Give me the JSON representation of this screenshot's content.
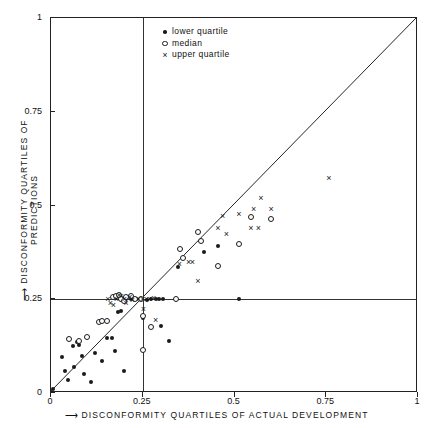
{
  "chart_data": {
    "type": "scatter",
    "title": "",
    "xlabel": "DISCONFORMITY QUARTILES OF ACTUAL DEVELOPMENT",
    "ylabel": "DISCONFORMITY QUARTILES OF PREDICTIONS",
    "xlim": [
      0,
      1
    ],
    "ylim": [
      0,
      1
    ],
    "xticks": [
      "0",
      "0.25",
      "0.5",
      "0.75",
      "1"
    ],
    "xtick_values": [
      0,
      0.25,
      0.5,
      0.75,
      1
    ],
    "yticks": [
      "0",
      "0.25",
      "0.5",
      "0.75",
      "1"
    ],
    "ytick_values": [
      0,
      0.25,
      0.5,
      0.75,
      1
    ],
    "grid": "interior gridlines at x=0.25 and y=0.25",
    "reference_line": {
      "name": "identity-line",
      "from": [
        0,
        0
      ],
      "to": [
        1,
        1
      ]
    },
    "legend_position": "top-center-inside",
    "series": [
      {
        "name": "lower quartile",
        "marker": "filled-dot",
        "points": [
          [
            0.005,
            0.012
          ],
          [
            0.03,
            0.097
          ],
          [
            0.038,
            0.06
          ],
          [
            0.047,
            0.035
          ],
          [
            0.06,
            0.125
          ],
          [
            0.063,
            0.07
          ],
          [
            0.072,
            0.136
          ],
          [
            0.076,
            0.128
          ],
          [
            0.085,
            0.098
          ],
          [
            0.09,
            0.05
          ],
          [
            0.108,
            0.03
          ],
          [
            0.12,
            0.107
          ],
          [
            0.14,
            0.085
          ],
          [
            0.152,
            0.148
          ],
          [
            0.165,
            0.146
          ],
          [
            0.175,
            0.113
          ],
          [
            0.183,
            0.215
          ],
          [
            0.19,
            0.218
          ],
          [
            0.2,
            0.06
          ],
          [
            0.205,
            0.25
          ],
          [
            0.218,
            0.25
          ],
          [
            0.232,
            0.25
          ],
          [
            0.245,
            0.25
          ],
          [
            0.25,
            0.2
          ],
          [
            0.262,
            0.248
          ],
          [
            0.272,
            0.25
          ],
          [
            0.285,
            0.25
          ],
          [
            0.295,
            0.25
          ],
          [
            0.305,
            0.25
          ],
          [
            0.3,
            0.18
          ],
          [
            0.322,
            0.14
          ],
          [
            0.345,
            0.335
          ],
          [
            0.418,
            0.375
          ],
          [
            0.455,
            0.392
          ],
          [
            0.512,
            0.25
          ]
        ]
      },
      {
        "name": "median",
        "marker": "open-circle",
        "points": [
          [
            0.048,
            0.145
          ],
          [
            0.075,
            0.14
          ],
          [
            0.097,
            0.15
          ],
          [
            0.132,
            0.19
          ],
          [
            0.14,
            0.192
          ],
          [
            0.152,
            0.193
          ],
          [
            0.168,
            0.255
          ],
          [
            0.178,
            0.258
          ],
          [
            0.186,
            0.262
          ],
          [
            0.192,
            0.25
          ],
          [
            0.2,
            0.245
          ],
          [
            0.205,
            0.255
          ],
          [
            0.218,
            0.258
          ],
          [
            0.228,
            0.252
          ],
          [
            0.245,
            0.25
          ],
          [
            0.25,
            0.115
          ],
          [
            0.252,
            0.205
          ],
          [
            0.272,
            0.175
          ],
          [
            0.34,
            0.25
          ],
          [
            0.352,
            0.385
          ],
          [
            0.36,
            0.36
          ],
          [
            0.4,
            0.43
          ],
          [
            0.408,
            0.405
          ],
          [
            0.455,
            0.338
          ],
          [
            0.512,
            0.398
          ],
          [
            0.545,
            0.47
          ],
          [
            0.6,
            0.465
          ]
        ]
      },
      {
        "name": "upper quartile",
        "marker": "x",
        "points": [
          [
            0.155,
            0.252
          ],
          [
            0.162,
            0.24
          ],
          [
            0.17,
            0.236
          ],
          [
            0.178,
            0.25
          ],
          [
            0.185,
            0.262
          ],
          [
            0.192,
            0.258
          ],
          [
            0.2,
            0.25
          ],
          [
            0.205,
            0.24
          ],
          [
            0.215,
            0.255
          ],
          [
            0.222,
            0.248
          ],
          [
            0.238,
            0.252
          ],
          [
            0.25,
            0.252
          ],
          [
            0.252,
            0.225
          ],
          [
            0.26,
            0.25
          ],
          [
            0.268,
            0.252
          ],
          [
            0.28,
            0.253
          ],
          [
            0.285,
            0.195
          ],
          [
            0.35,
            0.345
          ],
          [
            0.375,
            0.35
          ],
          [
            0.385,
            0.35
          ],
          [
            0.4,
            0.3
          ],
          [
            0.455,
            0.44
          ],
          [
            0.468,
            0.472
          ],
          [
            0.478,
            0.425
          ],
          [
            0.512,
            0.478
          ],
          [
            0.545,
            0.44
          ],
          [
            0.552,
            0.49
          ],
          [
            0.565,
            0.44
          ],
          [
            0.572,
            0.52
          ],
          [
            0.6,
            0.49
          ],
          [
            0.757,
            0.573
          ]
        ]
      }
    ],
    "legend": [
      {
        "marker": "filled-dot",
        "label": "lower quartile"
      },
      {
        "marker": "open-circle",
        "label": "median"
      },
      {
        "marker": "x",
        "label": "upper quartile"
      }
    ]
  },
  "axis": {
    "x_arrow": "⟶",
    "y_arrow": "⟶"
  }
}
